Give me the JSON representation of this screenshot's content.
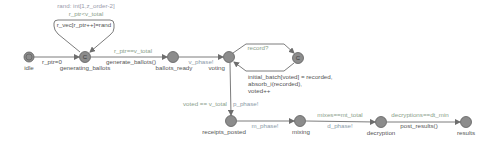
{
  "diagram": {
    "type": "timed-automaton",
    "colors": {
      "node_fill": "#8c8c8c",
      "node_stroke": "#5e5e5e",
      "edge": "#6d6d6d",
      "name_text": "#555555",
      "guard_text": "#8aa08a",
      "sync_text": "#8a9aa8",
      "update_text": "#555555",
      "select_text": "#9a9aaa"
    },
    "locations": [
      {
        "id": "idle",
        "label": "idle",
        "x": 29,
        "y": 57,
        "initial": true,
        "committed": false
      },
      {
        "id": "generating_ballots",
        "label": "generating_ballots",
        "x": 85,
        "y": 57,
        "initial": false,
        "committed": true,
        "marker": "C"
      },
      {
        "id": "ballots_ready",
        "label": "ballots_ready",
        "x": 173,
        "y": 57,
        "initial": false,
        "committed": false
      },
      {
        "id": "voting",
        "label": "voting",
        "x": 229,
        "y": 57,
        "initial": false,
        "committed": false
      },
      {
        "id": "voting_commit",
        "label": "",
        "x": 298,
        "y": 58,
        "initial": false,
        "committed": true,
        "marker": "C"
      },
      {
        "id": "receipts_posted",
        "label": "receipts_posted",
        "x": 231,
        "y": 121,
        "initial": false,
        "committed": false
      },
      {
        "id": "mixing",
        "label": "mixing",
        "x": 300,
        "y": 121,
        "initial": false,
        "committed": false
      },
      {
        "id": "decryption",
        "label": "decryption",
        "x": 381,
        "y": 122,
        "initial": false,
        "committed": false
      },
      {
        "id": "results",
        "label": "results",
        "x": 466,
        "y": 122,
        "initial": false,
        "committed": false
      }
    ],
    "edges": [
      {
        "from": "idle",
        "to": "generating_ballots",
        "update": "r_ptr=0"
      },
      {
        "from": "generating_ballots",
        "to": "generating_ballots",
        "select": "rand: int[1,z_order-2]",
        "guard": "r_ptr<v_total",
        "update": "r_vec[r_ptr++]=rand"
      },
      {
        "from": "generating_ballots",
        "to": "ballots_ready",
        "guard": "r_ptr==v_total",
        "update": "generate_ballots()"
      },
      {
        "from": "ballots_ready",
        "to": "voting",
        "sync": "v_phase!"
      },
      {
        "from": "voting",
        "to": "voting_commit",
        "sync": "record?"
      },
      {
        "from": "voting_commit",
        "to": "voting",
        "update_lines": [
          "initial_batch[voted] = recorded,",
          "absorb_i(recorded),",
          "voted++"
        ]
      },
      {
        "from": "voting",
        "to": "receipts_posted",
        "guard": "voted == v_total",
        "sync": "p_phase!"
      },
      {
        "from": "receipts_posted",
        "to": "mixing",
        "sync": "m_phase!"
      },
      {
        "from": "mixing",
        "to": "decryption",
        "guard": "mixes==mt_total",
        "sync": "d_phase!"
      },
      {
        "from": "decryption",
        "to": "results",
        "guard": "decryptions==dt_min",
        "update": "post_results()"
      }
    ]
  }
}
